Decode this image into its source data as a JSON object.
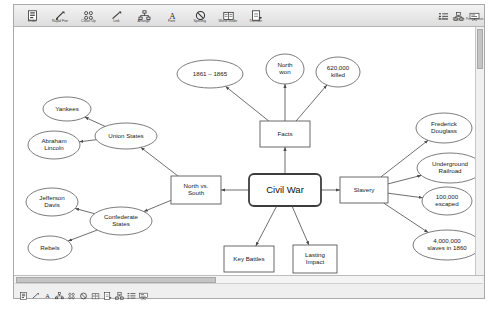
{
  "app": {
    "window_title": "Civil War Concept Map"
  },
  "toolbar": {
    "buttons": [
      {
        "label": "Order",
        "icon": "order-icon"
      },
      {
        "label": "Rapid Fire",
        "icon": "rapidfire-icon"
      },
      {
        "label": "Clean Up",
        "icon": "cleanup-icon"
      },
      {
        "label": "Link",
        "icon": "link-icon"
      },
      {
        "label": "Arrange",
        "icon": "arrange-icon"
      },
      {
        "label": "Font",
        "icon": "font-icon"
      },
      {
        "label": "Spelling",
        "icon": "spelling-icon"
      },
      {
        "label": "Word Guide",
        "icon": "wordguide-icon"
      },
      {
        "label": "Transfer",
        "icon": "transfer-icon"
      }
    ],
    "right_buttons": [
      {
        "label": "Outline",
        "icon": "outline-icon"
      },
      {
        "label": "Diagram",
        "icon": "diagram-icon"
      },
      {
        "label": "Presentation",
        "icon": "presentation-icon"
      }
    ]
  },
  "statusbar": {
    "hint": "Ready"
  },
  "scrollbars": {
    "vertical": "vertical-scrollbar",
    "horizontal": "horizontal-scrollbar"
  },
  "chart_data": {
    "type": "diagram",
    "nodes": [
      {
        "id": "civil-war",
        "label": "Civil War",
        "shape": "rounded-rect",
        "x": 281,
        "y": 185,
        "w": 72,
        "h": 32,
        "main": true
      },
      {
        "id": "facts",
        "label": "Facts",
        "shape": "rect",
        "x": 281,
        "y": 129,
        "w": 50,
        "h": 26
      },
      {
        "id": "slavery",
        "label": "Slavery",
        "shape": "rect",
        "x": 360,
        "y": 185,
        "w": 48,
        "h": 26
      },
      {
        "id": "north-south",
        "label": "North vs.\nSouth",
        "shape": "rect",
        "x": 192,
        "y": 185,
        "w": 50,
        "h": 28
      },
      {
        "id": "key-battles",
        "label": "Key Battles",
        "shape": "rect",
        "x": 245,
        "y": 254,
        "w": 50,
        "h": 26
      },
      {
        "id": "lasting",
        "label": "Lasting\nImpact",
        "shape": "rect",
        "x": 311,
        "y": 254,
        "w": 44,
        "h": 28
      },
      {
        "id": "years",
        "label": "1861 – 1865",
        "shape": "ellipse",
        "x": 206,
        "y": 69,
        "w": 66,
        "h": 28
      },
      {
        "id": "north-won",
        "label": "North\nwon",
        "shape": "ellipse",
        "x": 281,
        "y": 64,
        "w": 38,
        "h": 30
      },
      {
        "id": "killed",
        "label": "620,000\nkilled",
        "shape": "ellipse",
        "x": 334,
        "y": 67,
        "w": 44,
        "h": 30
      },
      {
        "id": "douglass",
        "label": "Frederick\nDouglass",
        "shape": "ellipse",
        "x": 440,
        "y": 123,
        "w": 56,
        "h": 30
      },
      {
        "id": "railroad",
        "label": "Underground\nRailroad",
        "shape": "ellipse",
        "x": 446,
        "y": 163,
        "w": 66,
        "h": 30
      },
      {
        "id": "escaped",
        "label": "100,000\nescaped",
        "shape": "ellipse",
        "x": 443,
        "y": 196,
        "w": 50,
        "h": 28
      },
      {
        "id": "slaves1860",
        "label": "4,000,000\nslaves in 1860",
        "shape": "ellipse",
        "x": 443,
        "y": 240,
        "w": 68,
        "h": 30
      },
      {
        "id": "union",
        "label": "Union States",
        "shape": "ellipse",
        "x": 122,
        "y": 131,
        "w": 62,
        "h": 26
      },
      {
        "id": "yankees",
        "label": "Yankees",
        "shape": "ellipse",
        "x": 63,
        "y": 104,
        "w": 48,
        "h": 24
      },
      {
        "id": "lincoln",
        "label": "Abraham\nLincoln",
        "shape": "ellipse",
        "x": 50,
        "y": 140,
        "w": 52,
        "h": 28
      },
      {
        "id": "confederate",
        "label": "Confederate\nStates",
        "shape": "ellipse",
        "x": 117,
        "y": 216,
        "w": 62,
        "h": 28
      },
      {
        "id": "davis",
        "label": "Jefferson\nDavis",
        "shape": "ellipse",
        "x": 48,
        "y": 197,
        "w": 52,
        "h": 28
      },
      {
        "id": "rebels",
        "label": "Rebels",
        "shape": "ellipse",
        "x": 46,
        "y": 243,
        "w": 44,
        "h": 24
      }
    ],
    "edges": [
      {
        "from": "civil-war",
        "to": "facts"
      },
      {
        "from": "civil-war",
        "to": "slavery"
      },
      {
        "from": "civil-war",
        "to": "north-south"
      },
      {
        "from": "civil-war",
        "to": "key-battles"
      },
      {
        "from": "civil-war",
        "to": "lasting"
      },
      {
        "from": "facts",
        "to": "years"
      },
      {
        "from": "facts",
        "to": "north-won"
      },
      {
        "from": "facts",
        "to": "killed"
      },
      {
        "from": "slavery",
        "to": "douglass"
      },
      {
        "from": "slavery",
        "to": "railroad"
      },
      {
        "from": "slavery",
        "to": "escaped"
      },
      {
        "from": "slavery",
        "to": "slaves1860"
      },
      {
        "from": "north-south",
        "to": "union"
      },
      {
        "from": "north-south",
        "to": "confederate"
      },
      {
        "from": "union",
        "to": "yankees"
      },
      {
        "from": "union",
        "to": "lincoln"
      },
      {
        "from": "confederate",
        "to": "davis"
      },
      {
        "from": "confederate",
        "to": "rebels"
      }
    ]
  }
}
